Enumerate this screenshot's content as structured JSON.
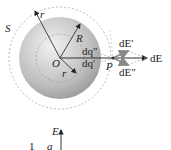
{
  "diagram": {
    "labels": {
      "surface": "S",
      "outer_radius": "r",
      "sphere_radius": "R",
      "center": "O",
      "inner_radius": "r",
      "charge_upper": "dq\"",
      "charge_lower": "dq'",
      "point": "P",
      "field_upper": "dE'",
      "field_lower": "dE\"",
      "field_total": "dE"
    },
    "graph": {
      "y_axis_label": "E",
      "label_1": "1",
      "label_a": "a"
    },
    "colors": {
      "sphere_light": "#eeeeee",
      "sphere_dark": "#9a9a9a",
      "dashed": "#aaaaaa",
      "line": "#333333"
    }
  }
}
